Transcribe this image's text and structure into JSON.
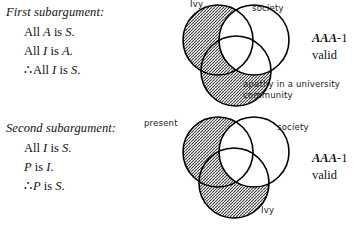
{
  "arguments": [
    {
      "heading": "First subargument:",
      "lines": [
        {
          "prefix": "All ",
          "var1": "A",
          "mid": " is ",
          "var2": "S",
          "suffix": ".",
          "therefore": false
        },
        {
          "prefix": "All ",
          "var1": "I",
          "mid": " is ",
          "var2": "A",
          "suffix": ".",
          "therefore": false
        },
        {
          "prefix": "All ",
          "var1": "I",
          "mid": " is ",
          "var2": "S",
          "suffix": ".",
          "therefore": true
        }
      ],
      "verdict": {
        "mood": "AAA",
        "figure": "-1",
        "status": "valid"
      }
    },
    {
      "heading": "Second subargument:",
      "lines": [
        {
          "prefix": "All ",
          "var1": "I",
          "mid": " is ",
          "var2": "S",
          "suffix": ".",
          "therefore": false
        },
        {
          "prefix": "",
          "var1": "P",
          "mid": " is ",
          "var2": "I",
          "suffix": ".",
          "therefore": false
        },
        {
          "prefix": "",
          "var1": "P",
          "mid": " is ",
          "var2": "S",
          "suffix": ".",
          "therefore": true
        }
      ],
      "verdict": {
        "mood": "AAA",
        "figure": "-1",
        "status": "valid"
      }
    }
  ],
  "therefore_symbol": "∴",
  "diagrams": [
    {
      "name": "first-subargument-venn",
      "labels": {
        "top_left": "Ivy",
        "top_right": "society",
        "bottom": "apathy in a university community"
      }
    },
    {
      "name": "second-subargument-venn",
      "labels": {
        "top_left": "present",
        "top_right": "society",
        "bottom": "Ivy"
      }
    }
  ],
  "colors": {
    "ink": "#000000",
    "hatch": "#3a3a3a",
    "paper": "#ffffff"
  }
}
